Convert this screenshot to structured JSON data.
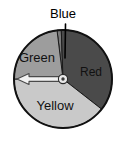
{
  "figure": {
    "type": "pie",
    "background_color": "#ffffff",
    "outline_color": "#111111"
  },
  "callout": {
    "label": "Blue",
    "leader_line_color": "#000000",
    "font_size": 13
  },
  "spinner": {
    "center_x": 63,
    "center_y": 79,
    "radius": 49,
    "hub": {
      "name": "center-hub",
      "outer_radius": 4.6,
      "inner_radius": 1.7,
      "outer_fill": "#e8e8e8",
      "inner_fill": "#3a3a3a",
      "stroke": "#2a2a2a"
    },
    "pointer": {
      "name": "spinner-arrow",
      "direction_degrees": 180,
      "length": 46,
      "fill": "#f2f2f2",
      "stroke": "#4a4a4a"
    }
  },
  "chart_data": {
    "type": "pie",
    "categories": [
      "Red",
      "Yellow",
      "Green",
      "Blue"
    ],
    "values": [
      36,
      40,
      23,
      1
    ],
    "labels_shown": [
      "Green",
      "Blue",
      "Red",
      "Yellow"
    ],
    "legend": "none",
    "colors": {
      "Red": "#4a4a4a",
      "Yellow": "#c9c9c9",
      "Green": "#9d9d9d",
      "Blue": "#7a7a7a"
    },
    "sectors": [
      {
        "name": "Blue",
        "label": "Blue",
        "start_angle": 92,
        "end_angle": 97,
        "fill": "#7a7a7a",
        "label_placement": "callout-above",
        "label_x": 63,
        "label_y": 14
      },
      {
        "name": "Red",
        "label": "Red",
        "start_angle": -38,
        "end_angle": 92,
        "fill": "#4a4a4a",
        "label_placement": "inside",
        "label_x": 91,
        "label_y": 76,
        "label_fill": "#f5f5f5",
        "font_size": 12
      },
      {
        "name": "Yellow",
        "label": "Yellow",
        "start_angle": 180,
        "end_angle": 322,
        "fill": "#c9c9c9",
        "label_placement": "inside",
        "label_x": 55,
        "label_y": 110,
        "label_fill": "#141414",
        "font_size": 13
      },
      {
        "name": "Green",
        "label": "Green",
        "start_angle": 97,
        "end_angle": 180,
        "fill": "#9d9d9d",
        "label_placement": "inside",
        "label_x": 37,
        "label_y": 62,
        "label_fill": "#141414",
        "font_size": 13
      }
    ],
    "xlabel": "",
    "ylabel": ""
  }
}
